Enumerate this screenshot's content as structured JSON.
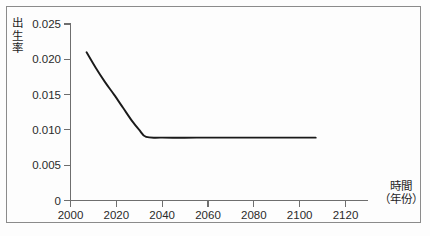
{
  "chart_data": {
    "type": "line",
    "title": "",
    "subtitle": "",
    "xlabel": "時間",
    "xlabel_unit": "（年份）",
    "ylabel": "出生率",
    "xlim": [
      2000,
      2120
    ],
    "ylim": [
      0,
      0.025
    ],
    "grid": false,
    "legend": false,
    "legend_position": "none",
    "x_ticks": [
      2000,
      2020,
      2040,
      2060,
      2080,
      2100,
      2120
    ],
    "x_tick_labels": [
      "2000",
      "2020",
      "2040",
      "2060",
      "2080",
      "2100",
      "2120"
    ],
    "y_ticks": [
      0,
      0.005,
      0.01,
      0.015,
      0.02,
      0.025
    ],
    "y_tick_labels": [
      "0",
      "0.005",
      "0.010",
      "0.015",
      "0.020",
      "0.025"
    ],
    "series": [
      {
        "name": "出生率",
        "color": "#1a1a1a",
        "x": [
          2007,
          2011,
          2015,
          2019,
          2023,
          2027,
          2030,
          2033,
          2040,
          2055,
          2070,
          2085,
          2100,
          2107
        ],
        "values": [
          0.021,
          0.0188,
          0.0168,
          0.015,
          0.0131,
          0.0112,
          0.01,
          0.009,
          0.0089,
          0.0089,
          0.0089,
          0.0089,
          0.0089,
          0.0089
        ]
      }
    ],
    "annotations": []
  },
  "axes": {
    "y_title_chars": [
      "出",
      "生",
      "率"
    ],
    "x_title": "時間",
    "x_title_unit": "（年份）"
  },
  "colors": {
    "line": "#1a1a1a",
    "axis": "#6e6e6e",
    "frame": "#8b8b8b",
    "text": "#2a2a2a",
    "background": "#fdfdfd"
  }
}
